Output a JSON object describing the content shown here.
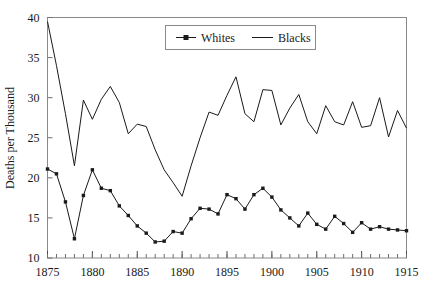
{
  "chart_data": {
    "type": "line",
    "title": "",
    "xlabel": "",
    "ylabel": "Deaths per Thousand",
    "xlim": [
      1875,
      1915
    ],
    "ylim": [
      10,
      40
    ],
    "ytick_labels": [
      "10",
      "15",
      "20",
      "25",
      "30",
      "35",
      "40"
    ],
    "yticks": [
      10,
      15,
      20,
      25,
      30,
      35,
      40
    ],
    "xtick_labels": [
      "1875",
      "1880",
      "1885",
      "1890",
      "1895",
      "1900",
      "1905",
      "1910",
      "1915"
    ],
    "xticks": [
      1875,
      1880,
      1885,
      1890,
      1895,
      1900,
      1905,
      1910,
      1915
    ],
    "minor_xtick_interval": 1,
    "grid": false,
    "legend_position": "top-center",
    "x": [
      1875,
      1876,
      1877,
      1878,
      1879,
      1880,
      1881,
      1882,
      1883,
      1884,
      1885,
      1886,
      1887,
      1888,
      1889,
      1890,
      1891,
      1892,
      1893,
      1894,
      1895,
      1896,
      1897,
      1898,
      1899,
      1900,
      1901,
      1902,
      1903,
      1904,
      1905,
      1906,
      1907,
      1908,
      1909,
      1910,
      1911,
      1912,
      1913,
      1914,
      1915
    ],
    "series": [
      {
        "name": "Whites",
        "marker": "square",
        "color": "#1a1a1a",
        "values": [
          21.1,
          20.5,
          17.0,
          12.4,
          17.8,
          21.0,
          18.7,
          18.4,
          16.5,
          15.3,
          14.0,
          13.1,
          12.0,
          12.1,
          13.3,
          13.1,
          14.9,
          16.2,
          16.1,
          15.5,
          17.9,
          17.4,
          16.1,
          17.9,
          18.7,
          17.6,
          16.0,
          15.0,
          14.0,
          15.6,
          14.2,
          13.6,
          15.2,
          14.3,
          13.2,
          14.4,
          13.6,
          13.9,
          13.6,
          13.5,
          13.4
        ]
      },
      {
        "name": "Blacks",
        "marker": "none",
        "color": "#1a1a1a",
        "values": [
          39.5,
          34.0,
          28.0,
          21.5,
          29.7,
          27.3,
          29.8,
          31.4,
          29.4,
          25.5,
          26.7,
          26.4,
          23.5,
          21.0,
          19.4,
          17.7,
          21.5,
          25.0,
          28.2,
          27.8,
          30.3,
          32.6,
          28.0,
          27.0,
          31.0,
          30.9,
          26.6,
          28.7,
          30.4,
          27.0,
          25.5,
          29.0,
          27.0,
          26.6,
          29.5,
          26.3,
          26.5,
          30.0,
          25.1,
          28.4,
          26.2
        ]
      }
    ]
  },
  "legend": {
    "items": [
      {
        "label": "Whites"
      },
      {
        "label": "Blacks"
      }
    ]
  },
  "axes": {
    "y_axis_title": "Deaths per Thousand"
  }
}
